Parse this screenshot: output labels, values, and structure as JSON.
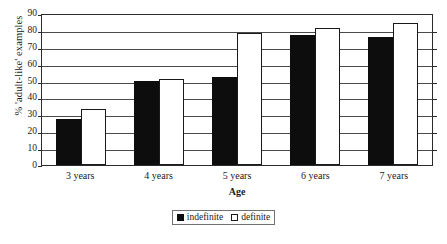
{
  "chart_data": {
    "type": "bar",
    "title": "",
    "xlabel": "Age",
    "ylabel": "% 'adult-like' examples",
    "ylim": [
      0,
      90
    ],
    "ytick_step": 10,
    "yticks": [
      90,
      80,
      70,
      60,
      50,
      40,
      30,
      20,
      10,
      0
    ],
    "grid": true,
    "legend_position": "bottom-center",
    "categories": [
      "3 years",
      "4 years",
      "5 years",
      "6 years",
      "7 years"
    ],
    "series": [
      {
        "name": "indefinite",
        "color": "#0d0d0d",
        "values": [
          27,
          50,
          52,
          77,
          76
        ]
      },
      {
        "name": "definite",
        "color": "#ffffff",
        "values": [
          33,
          51,
          78,
          81,
          84
        ]
      }
    ]
  },
  "legend": {
    "items": [
      {
        "label": "indefinite",
        "swatch": "filled-square-icon"
      },
      {
        "label": "definite",
        "swatch": "open-square-icon"
      }
    ]
  }
}
